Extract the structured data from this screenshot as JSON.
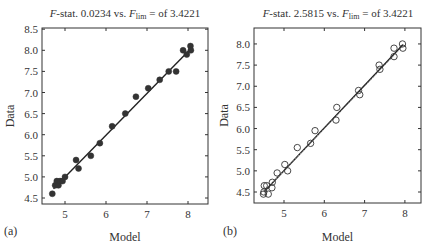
{
  "figure": {
    "panels": [
      {
        "id": "a",
        "panel_label": "(a)",
        "title_prefix": "F",
        "title_mid": "-stat. 0.0234 vs. ",
        "title_f": "F",
        "title_sub": "lim",
        "title_suffix": " = of 3.4221",
        "xlabel": "Model",
        "ylabel": "Data"
      },
      {
        "id": "b",
        "panel_label": "(b)",
        "title_prefix": "F",
        "title_mid": "-stat. 2.5815 vs. ",
        "title_f": "F",
        "title_sub": "lim",
        "title_suffix": " = of 3.4221",
        "xlabel": "Model",
        "ylabel": "Data"
      }
    ]
  },
  "chart_data": [
    {
      "type": "scatter",
      "title": "F-stat. 0.0234 vs. F_lim = of 3.4221",
      "panel_label": "(a)",
      "xlabel": "Model",
      "ylabel": "Data",
      "xlim": [
        4.45,
        8.5
      ],
      "ylim": [
        4.4,
        8.5
      ],
      "xticks": [
        5,
        6,
        7,
        8
      ],
      "yticks": [
        4.5,
        5.0,
        5.5,
        6.0,
        6.5,
        7.0,
        7.5,
        8.0,
        8.5
      ],
      "ytick_labels": [
        "4.5",
        "5.0",
        "5.5",
        "6.0",
        "6.5",
        "7.0",
        "7.5",
        "8.0",
        "8.5"
      ],
      "grid": false,
      "marker": "filled-circle",
      "series": [
        {
          "name": "observations",
          "x": [
            4.69,
            4.76,
            4.8,
            4.84,
            4.88,
            4.94,
            5.0,
            5.27,
            5.33,
            5.63,
            5.85,
            6.15,
            6.47,
            6.73,
            7.03,
            7.31,
            7.53,
            7.71,
            7.88,
            7.97,
            8.06,
            8.07
          ],
          "y": [
            4.6,
            4.8,
            4.9,
            4.8,
            4.9,
            4.9,
            5.0,
            5.4,
            5.2,
            5.5,
            5.8,
            6.2,
            6.5,
            6.9,
            7.1,
            7.3,
            7.5,
            7.5,
            8.0,
            7.9,
            8.1,
            8.0
          ]
        }
      ],
      "fit_lines": [
        {
          "name": "regression",
          "style": "solid",
          "x": [
            4.72,
            8.05
          ],
          "y": [
            4.72,
            8.02
          ]
        }
      ]
    },
    {
      "type": "scatter",
      "title": "F-stat. 2.5815 vs. F_lim = of 3.4221",
      "panel_label": "(b)",
      "xlabel": "Model",
      "ylabel": "Data",
      "xlim": [
        4.25,
        8.35
      ],
      "ylim": [
        4.2,
        8.4
      ],
      "xticks": [
        5,
        6,
        7,
        8
      ],
      "yticks": [
        4.5,
        5.0,
        5.5,
        6.0,
        6.5,
        7.0,
        7.5,
        8.0
      ],
      "ytick_labels": [
        "4.5",
        "5.0",
        "5.5",
        "6.0",
        "6.5",
        "7.0",
        "7.5",
        "8.0"
      ],
      "grid": false,
      "marker": "open-circle",
      "series": [
        {
          "name": "observations",
          "x": [
            4.49,
            4.61,
            4.5,
            4.51,
            4.57,
            4.71,
            4.7,
            4.83,
            5.02,
            5.09,
            5.33,
            5.66,
            5.77,
            6.29,
            6.31,
            6.85,
            6.88,
            7.36,
            7.38,
            7.73,
            7.73,
            7.94,
            7.95
          ],
          "y": [
            4.45,
            4.45,
            4.5,
            4.65,
            4.65,
            4.73,
            4.6,
            4.95,
            5.15,
            5.0,
            5.55,
            5.65,
            5.95,
            6.2,
            6.5,
            6.9,
            6.8,
            7.5,
            7.4,
            7.9,
            7.7,
            8.0,
            7.9
          ]
        }
      ],
      "fit_lines": [
        {
          "name": "regression",
          "style": "solid",
          "x": [
            4.5,
            7.95
          ],
          "y": [
            4.5,
            7.98
          ]
        },
        {
          "name": "identity",
          "style": "dashed",
          "x": [
            4.5,
            7.95
          ],
          "y": [
            4.5,
            7.95
          ]
        }
      ]
    }
  ]
}
